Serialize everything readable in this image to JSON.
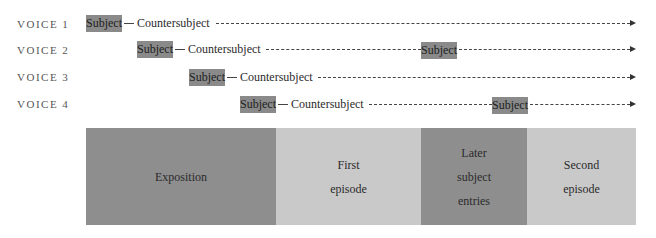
{
  "voices": [
    {
      "label": "VOICE 1",
      "subject": "Subject",
      "countersubject": "Countersubject"
    },
    {
      "label": "VOICE 2",
      "subject": "Subject",
      "countersubject": "Countersubject",
      "later_subject": "Subject"
    },
    {
      "label": "VOICE 3",
      "subject": "Subject",
      "countersubject": "Countersubject"
    },
    {
      "label": "VOICE 4",
      "subject": "Subject",
      "countersubject": "Countersubject",
      "later_subject": "Subject"
    }
  ],
  "sections": [
    {
      "lines": [
        "Exposition"
      ],
      "shade": "dark"
    },
    {
      "lines": [
        "First",
        "episode"
      ],
      "shade": "light"
    },
    {
      "lines": [
        "Later",
        "subject",
        "entries"
      ],
      "shade": "dark"
    },
    {
      "lines": [
        "Second",
        "episode"
      ],
      "shade": "light"
    }
  ],
  "colors": {
    "subject_box": "#8a8a8a",
    "dark_section": "#8e8e8e",
    "light_section": "#c9c9c9"
  }
}
